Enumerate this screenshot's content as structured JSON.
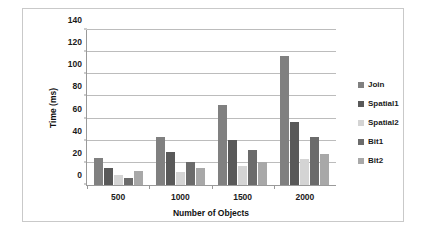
{
  "chart_data": {
    "type": "bar",
    "title": "",
    "xlabel": "Number of Objects",
    "ylabel": "Time (ms)",
    "categories": [
      "500",
      "1000",
      "1500",
      "2000"
    ],
    "series": [
      {
        "name": "Join",
        "color": "#808080",
        "values": [
          24,
          43,
          72,
          116
        ]
      },
      {
        "name": "Spatial1",
        "color": "#595959",
        "values": [
          15,
          30,
          40,
          57
        ]
      },
      {
        "name": "Spatial2",
        "color": "#d4d4d4",
        "values": [
          9,
          12,
          17,
          23
        ]
      },
      {
        "name": "Bit1",
        "color": "#6b6b6b",
        "values": [
          6,
          21,
          31,
          43
        ]
      },
      {
        "name": "Bit2",
        "color": "#a8a8a8",
        "values": [
          13,
          15,
          21,
          28
        ]
      }
    ],
    "ylim": [
      0,
      140
    ],
    "yticks": [
      0,
      20,
      40,
      60,
      80,
      100,
      120,
      140
    ],
    "ytick_labels": [
      "0",
      "20",
      "40",
      "60",
      "80",
      "100",
      "120",
      "140"
    ],
    "grid": "horizontal",
    "legend_position": "right"
  }
}
